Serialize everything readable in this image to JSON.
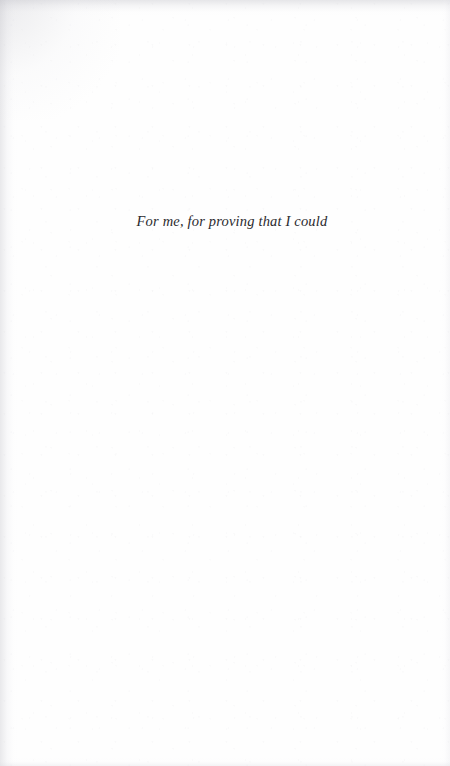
{
  "page": {
    "kind": "book-dedication-page",
    "background_color": "#fefefe",
    "text_color": "#2b2a2e",
    "edge_shadow_color": "#c4c4ca"
  },
  "dedication": {
    "text": "For me, for proving that I could"
  }
}
